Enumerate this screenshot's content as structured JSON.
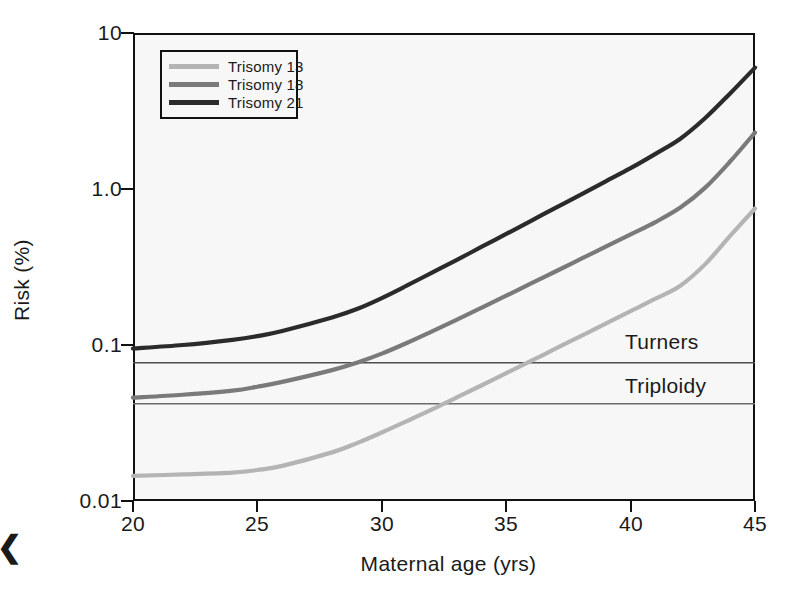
{
  "figure": {
    "corner_mark": "❮"
  },
  "axes": {
    "xlabel": "Maternal age (yrs)",
    "ylabel": "Risk (%)",
    "xticks": [
      "20",
      "25",
      "30",
      "35",
      "40",
      "45"
    ],
    "yticks": [
      "10",
      "1.0",
      "0.1",
      "0.01"
    ]
  },
  "legend": {
    "items": [
      {
        "label": "Trisomy 13",
        "color": "#b4b4b4"
      },
      {
        "label": "Trisomy 18",
        "color": "#7a7a7a"
      },
      {
        "label": "Trisomy 21",
        "color": "#2b2b2b"
      }
    ]
  },
  "annotations": {
    "turners": "Turners",
    "triploidy": "Triploidy"
  },
  "chart_data": {
    "type": "line",
    "title": "",
    "xlabel": "Maternal age (yrs)",
    "ylabel": "Risk (%)",
    "xlim": [
      20,
      45
    ],
    "ylim": [
      0.01,
      10
    ],
    "yscale": "log",
    "xscale": "linear",
    "grid": false,
    "legend_position": "upper-left-inside",
    "xticks": [
      20,
      25,
      30,
      35,
      40,
      45
    ],
    "yticks": [
      0.01,
      0.1,
      1.0,
      10
    ],
    "x": [
      20,
      22,
      24,
      25,
      26,
      28,
      29,
      30,
      31,
      32,
      33,
      34,
      35,
      36,
      37,
      38,
      39,
      40,
      41,
      42,
      43,
      44,
      45
    ],
    "series": [
      {
        "name": "Trisomy 13",
        "color": "#b4b4b4",
        "values": [
          0.0145,
          0.0148,
          0.0152,
          0.0158,
          0.0168,
          0.0205,
          0.0235,
          0.0275,
          0.0325,
          0.0385,
          0.046,
          0.055,
          0.066,
          0.079,
          0.095,
          0.114,
          0.137,
          0.165,
          0.198,
          0.24,
          0.33,
          0.5,
          0.75
        ]
      },
      {
        "name": "Trisomy 18",
        "color": "#7a7a7a",
        "values": [
          0.046,
          0.048,
          0.051,
          0.054,
          0.058,
          0.069,
          0.077,
          0.088,
          0.103,
          0.122,
          0.145,
          0.173,
          0.207,
          0.248,
          0.297,
          0.356,
          0.427,
          0.512,
          0.614,
          0.76,
          1.02,
          1.5,
          2.3
        ]
      },
      {
        "name": "Trisomy 21",
        "color": "#2b2b2b",
        "values": [
          0.095,
          0.1,
          0.108,
          0.114,
          0.123,
          0.15,
          0.17,
          0.2,
          0.24,
          0.29,
          0.35,
          0.425,
          0.515,
          0.625,
          0.76,
          0.92,
          1.12,
          1.36,
          1.68,
          2.1,
          2.85,
          4.1,
          6.0
        ]
      }
    ],
    "reference_lines": [
      {
        "name": "Turners",
        "value": 0.077,
        "label": "Turners",
        "color": "#4d4d4d"
      },
      {
        "name": "Triploidy",
        "value": 0.042,
        "label": "Triploidy",
        "color": "#6b6b6b"
      }
    ]
  }
}
